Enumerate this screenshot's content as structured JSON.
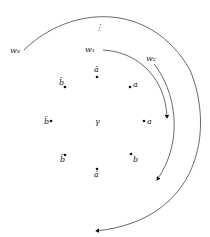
{
  "diagram": {
    "center_label": "γ",
    "ellipsis": "⋮",
    "nodes": [
      {
        "label": "ā",
        "pos": "top"
      },
      {
        "label": "a",
        "pos": "top-right"
      },
      {
        "label": "a",
        "pos": "right"
      },
      {
        "label": "b",
        "pos": "bottom-right"
      },
      {
        "label": "ā",
        "pos": "bottom"
      },
      {
        "label": "b̄",
        "pos": "bottom-left"
      },
      {
        "label": "b̄",
        "pos": "left"
      },
      {
        "label": "b̄",
        "pos": "top-left"
      }
    ],
    "arcs": [
      {
        "label": "w₁"
      },
      {
        "label": "w₂"
      },
      {
        "label": "w₃"
      }
    ]
  }
}
